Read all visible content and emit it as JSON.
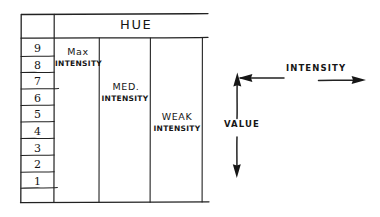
{
  "diagram": {
    "title_header": "HUE",
    "value_scale": {
      "name": "value-scale",
      "ticks": [
        "9",
        "8",
        "7",
        "6",
        "5",
        "4",
        "3",
        "2",
        "1"
      ]
    },
    "bands": [
      {
        "name": "max-intensity",
        "line1": "Max",
        "line2": "INTENSITY"
      },
      {
        "name": "med-intensity",
        "line1": "MED.",
        "line2": "INTENSITY"
      },
      {
        "name": "weak-intensity",
        "line1": "WEAK",
        "line2": "INTENSITY"
      }
    ],
    "axes": {
      "horizontal_label": "INTENSITY",
      "vertical_label": "VALUE"
    },
    "colors": {
      "ink": "#161616",
      "paper": "#ffffff"
    }
  }
}
